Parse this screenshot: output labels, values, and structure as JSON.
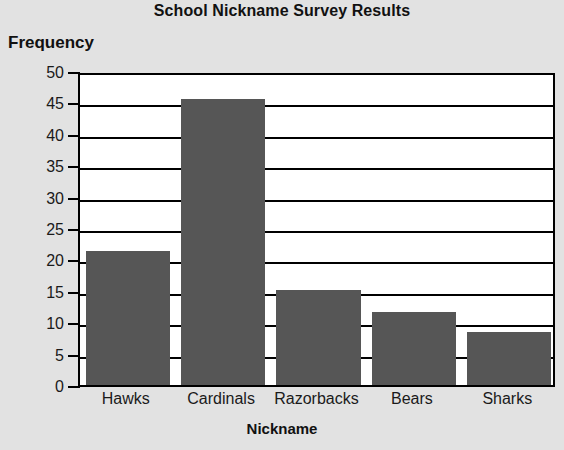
{
  "chart_data": {
    "type": "bar",
    "title": "School Nickname Survey Results",
    "xlabel": "Nickname",
    "ylabel": "Frequency",
    "categories": [
      "Hawks",
      "Cardinals",
      "Razorbacks",
      "Bears",
      "Sharks"
    ],
    "values": [
      21.3,
      45.5,
      15.2,
      11.6,
      8.5
    ],
    "ylim": [
      0,
      50
    ],
    "ytick_labels": [
      "0",
      "5",
      "10",
      "15",
      "20",
      "25",
      "30",
      "35",
      "40",
      "45",
      "50"
    ],
    "ytick_values": [
      0,
      5,
      10,
      15,
      20,
      25,
      30,
      35,
      40,
      45,
      50
    ],
    "grid": "horizontal",
    "legend": "none",
    "bar_color": "#565656",
    "plot_background": "#ffffff",
    "page_background": "#e2e2e2",
    "axis_color": "#000000"
  }
}
